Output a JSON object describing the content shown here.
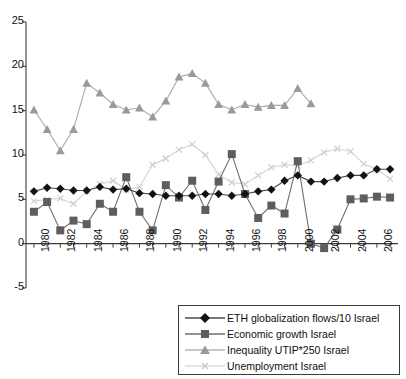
{
  "chart_data": {
    "type": "line",
    "title": "",
    "xlabel": "",
    "ylabel": "",
    "xlim": [
      1979.4,
      2007.6
    ],
    "ylim": [
      -5,
      25
    ],
    "yticks": [
      25,
      20,
      15,
      10,
      5,
      0,
      -5
    ],
    "ytick_labels": [
      "25",
      "20",
      "15",
      "10",
      "5",
      "0",
      "-5"
    ],
    "grid": false,
    "legend_position": "bottom-right",
    "x": [
      1980,
      1981,
      1982,
      1983,
      1984,
      1985,
      1986,
      1987,
      1988,
      1989,
      1990,
      1991,
      1992,
      1993,
      1994,
      1995,
      1996,
      1997,
      1998,
      1999,
      2000,
      2001,
      2002,
      2003,
      2004,
      2005,
      2006,
      2007
    ],
    "xtick_labels": [
      "1980",
      "1982",
      "1984",
      "1986",
      "1988",
      "1990",
      "1992",
      "1994",
      "1996",
      "1998",
      "2000",
      "2002",
      "2004",
      "2006"
    ],
    "series": [
      {
        "name": "ETH globalization flows/10 Israel",
        "marker": "diamond",
        "color": "#121212",
        "line_color": "#4a4a4a",
        "values": [
          5.9,
          6.3,
          6.2,
          6.0,
          6.0,
          6.4,
          6.1,
          6.2,
          5.7,
          5.6,
          5.4,
          5.4,
          5.4,
          5.6,
          5.6,
          5.4,
          5.6,
          5.9,
          6.1,
          7.1,
          7.7,
          7.0,
          7.0,
          7.4,
          7.7,
          7.7,
          8.4,
          8.4
        ]
      },
      {
        "name": "Economic growth Israel",
        "marker": "square",
        "color": "#5e5e5e",
        "line_color": "#6e6e6e",
        "values": [
          3.6,
          4.7,
          1.5,
          2.6,
          2.2,
          4.5,
          3.6,
          7.5,
          3.6,
          1.5,
          6.6,
          5.2,
          7.1,
          3.8,
          7.0,
          10.1,
          5.6,
          2.9,
          4.3,
          3.4,
          9.3,
          0.0,
          -0.5,
          1.6,
          5.0,
          5.1,
          5.3,
          5.2
        ]
      },
      {
        "name": "Inequality UTIP*250 Israel",
        "marker": "triangle",
        "color": "#9a9a9a",
        "line_color": "#a8a8a8",
        "values": [
          15.1,
          12.9,
          10.5,
          12.9,
          18.1,
          17.0,
          15.7,
          15.1,
          15.3,
          14.3,
          16.1,
          18.8,
          19.2,
          18.1,
          15.7,
          15.1,
          15.7,
          15.4,
          15.6,
          15.6,
          17.5,
          15.8,
          null,
          null,
          null,
          null,
          null,
          null
        ]
      },
      {
        "name": "Unemployment Israel",
        "marker": "cross",
        "color": "#cfcfcf",
        "line_color": "#d4d4d4",
        "values": [
          4.8,
          5.0,
          5.1,
          4.5,
          5.9,
          6.7,
          7.1,
          6.1,
          6.4,
          8.9,
          9.6,
          10.6,
          11.2,
          10.0,
          7.8,
          6.9,
          6.7,
          7.7,
          8.6,
          8.9,
          8.8,
          9.4,
          10.3,
          10.7,
          10.4,
          9.0,
          8.4,
          7.3
        ]
      }
    ]
  },
  "legend": {
    "items": [
      {
        "label": "ETH globalization flows/10 Israel",
        "marker": "diamond-marker-icon"
      },
      {
        "label": "Economic growth Israel",
        "marker": "square-marker-icon"
      },
      {
        "label": "Inequality UTIP*250 Israel",
        "marker": "triangle-marker-icon"
      },
      {
        "label": "Unemployment Israel",
        "marker": "cross-marker-icon"
      }
    ]
  }
}
